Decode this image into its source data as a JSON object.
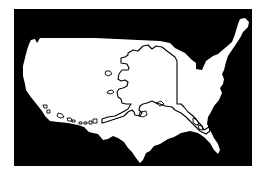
{
  "map": {
    "title": "Alaska overlaid on the contiguous United States",
    "subject": "size comparison",
    "layers": [
      {
        "id": "contiguous-us",
        "label": "Contiguous United States",
        "style": "filled silhouette"
      },
      {
        "id": "alaska",
        "label": "Alaska",
        "style": "outline"
      },
      {
        "id": "aleutian-islands",
        "label": "Aleutian Islands",
        "style": "outline"
      }
    ],
    "colors": {
      "page_background": "#ffffff",
      "ocean_background": "#000000",
      "land_fill": "#ffffff",
      "outline_stroke": "#000000"
    }
  }
}
